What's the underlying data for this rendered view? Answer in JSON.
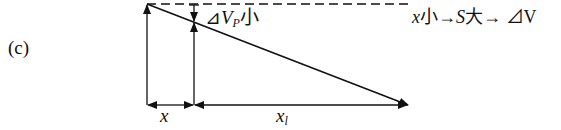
{
  "panel_label": "(c)",
  "annotations": {
    "delta_vp": {
      "prefix": "⊿",
      "var": "V",
      "sub": "P",
      "suffix": "小"
    },
    "note": {
      "x": "x",
      "t1": "小→",
      "s": "S",
      "t2": "大→ ⊿V"
    }
  },
  "axis_labels": {
    "x": "x",
    "xl_main": "x",
    "xl_sub": "l"
  },
  "geometry": {
    "origin": [
      147,
      105
    ],
    "top_left": [
      147,
      4
    ],
    "end": [
      408,
      105
    ],
    "x_split": 194,
    "dashed_end": 410
  }
}
